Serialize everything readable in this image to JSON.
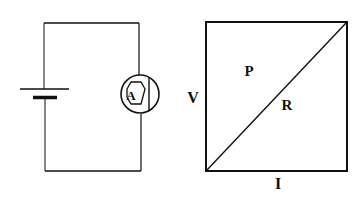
{
  "circuit": {
    "components": [
      "battery",
      "ammeter"
    ],
    "ammeter_label": "A"
  },
  "graph": {
    "y_axis_label": "V",
    "x_axis_label": "I",
    "region_above_label": "P",
    "line_label": "R"
  },
  "colors": {
    "stroke": "#111111",
    "background": "#ffffff"
  }
}
